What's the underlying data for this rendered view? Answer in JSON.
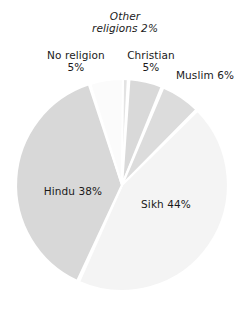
{
  "chart_data": {
    "type": "pie",
    "title": "",
    "categories": [
      "Other religions",
      "Christian",
      "Muslim",
      "Sikh",
      "Hindu",
      "No religion"
    ],
    "values": [
      2,
      5,
      6,
      44,
      38,
      5
    ],
    "unit": "%",
    "legend": "none",
    "grid": false,
    "slices": [
      {
        "label": "Other religions",
        "value": 2,
        "display": "Other religions 2%",
        "color": "#e3e3e3",
        "start_deg": -4,
        "sweep_deg": 7.2
      },
      {
        "label": "Christian",
        "value": 5,
        "display": "Christian 5%",
        "color": "#d9d9d9",
        "start_deg": 4,
        "sweep_deg": 18.0
      },
      {
        "label": "Muslim",
        "value": 6,
        "display": "Muslim 6%",
        "color": "#dcdcdc",
        "start_deg": 23,
        "sweep_deg": 21.6
      },
      {
        "label": "Sikh",
        "value": 44,
        "display": "Sikh 44%",
        "color": "#f4f4f4",
        "start_deg": 45.5,
        "sweep_deg": 158.4
      },
      {
        "label": "Hindu",
        "value": 38,
        "display": "Hindu 38%",
        "color": "#d8d8d8",
        "start_deg": 205,
        "sweep_deg": 136.8
      },
      {
        "label": "No religion",
        "value": 5,
        "display": "No religion 5%",
        "color": "#fbfbfb",
        "start_deg": 342.5,
        "sweep_deg": 18.0
      }
    ],
    "geometry": {
      "cx": 122,
      "cy": 185,
      "r": 106
    }
  },
  "labels": {
    "other_religions_line1": "Other",
    "other_religions_line2": "religions 2%",
    "no_religion_line1": "No religion",
    "no_religion_line2": "5%",
    "christian_line1": "Christian",
    "christian_line2": "5%",
    "muslim": "Muslim 6%",
    "hindu": "Hindu 38%",
    "sikh": "Sikh 44%"
  },
  "colors": {
    "background": "#ffffff",
    "text": "#1a1a1a",
    "slice_light": "#f4f4f4",
    "slice_mid": "#d8d8d8",
    "slice_white": "#fbfbfb",
    "separator": "#ffffff"
  }
}
